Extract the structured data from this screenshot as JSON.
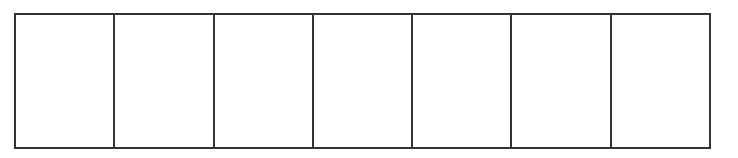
{
  "diagram": {
    "type": "grid-row",
    "rows": 1,
    "columns": 7,
    "border_color": "#333333",
    "background_color": "#ffffff",
    "cells": [
      "",
      "",
      "",
      "",
      "",
      "",
      ""
    ]
  }
}
